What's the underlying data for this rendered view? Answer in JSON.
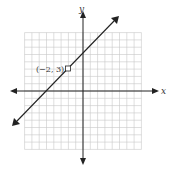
{
  "chart_data": {
    "type": "line",
    "title": "",
    "xlabel": "x",
    "ylabel": "y",
    "xlim": [
      -8,
      8
    ],
    "ylim": [
      -8,
      8
    ],
    "grid": true,
    "series": [
      {
        "name": "line",
        "equation": "y = x + 5",
        "x": [
          -10,
          10
        ],
        "y": [
          -5,
          15
        ]
      }
    ],
    "annotations": [
      {
        "label": "(−2, 3)",
        "x": -2,
        "y": 3,
        "marker": "open-square"
      }
    ]
  },
  "labels": {
    "x_axis": "x",
    "y_axis": "y",
    "point": "(−2, 3)"
  }
}
